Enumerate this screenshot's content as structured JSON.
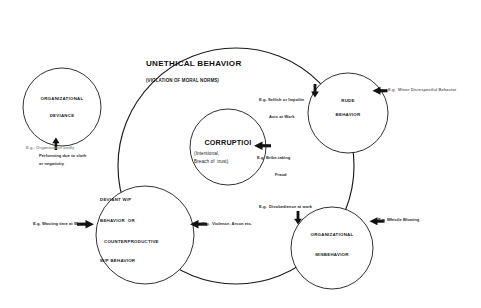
{
  "diagram": {
    "outer": {
      "title": "UNETHICAL BEHAVIOR",
      "subtitle": "(VIOLATION OF MORAL NORMS)"
    },
    "circles": [
      {
        "id": "organizational-deviance",
        "lines": [
          "ORGANIZATIONAL",
          "DEVIANCE"
        ]
      },
      {
        "id": "corruption",
        "title": "CORRUPTIOI",
        "sub_lines": [
          "(Intentional,",
          "Breach of  trust)"
        ]
      },
      {
        "id": "rude-behavior",
        "lines": [
          "RUDE",
          "BEHAVIOR"
        ]
      },
      {
        "id": "deviant-workplace-behavior",
        "lines": [
          "DEVIANT W/P",
          "BEHAVIOR  OR",
          "COUNTERPRODUCTIVE",
          "W/P BEHAVIOR"
        ]
      },
      {
        "id": "organizational-misbehavior",
        "lines": [
          "ORGANIZATIONAL",
          "MISBEHAVIOR"
        ]
      }
    ],
    "examples": [
      {
        "id": "example-organisation-badly-performing",
        "lines": [
          "E.g.: Organisation badly",
          "Performing due to sloth",
          "or negativity"
        ]
      },
      {
        "id": "example-wasting-time",
        "lines": [
          "E.g. Wasting time at Wp"
        ]
      },
      {
        "id": "example-violence-arson",
        "lines": [
          "E.g.  Violence, Arson etc."
        ]
      },
      {
        "id": "example-selfish-impolite",
        "lines": [
          "E.g. Selfish or Impolite",
          "Acts at Work"
        ]
      },
      {
        "id": "example-bribe-taking",
        "lines": [
          "E.g. Bribe-taking",
          "Fraud"
        ]
      },
      {
        "id": "example-minor-disrespectful",
        "lines": [
          "E.g.  Minor Disrespectful Behavior"
        ]
      },
      {
        "id": "example-disobedience",
        "lines": [
          "E.g.  Disobedience at work"
        ]
      },
      {
        "id": "example-whistle-blowing",
        "lines": [
          "E.g. Whistle Blowing"
        ]
      }
    ],
    "colors": {
      "stroke": "#1a1a1a",
      "fill": "#ffffff",
      "text": "#1a1a1a",
      "faint_text": "#8d8d8d"
    }
  }
}
